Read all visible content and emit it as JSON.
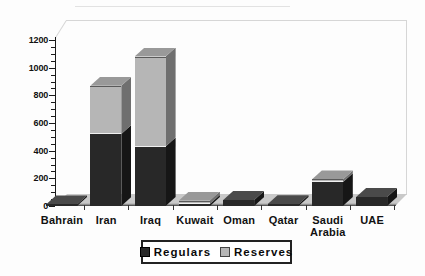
{
  "chart_data": {
    "type": "bar",
    "subtype": "stacked-3d",
    "title": "",
    "xlabel": "",
    "ylabel": "",
    "categories": [
      "Bahrain",
      "Iran",
      "Iraq",
      "Kuwait",
      "Oman",
      "Qatar",
      "Saudi Arabia",
      "UAE"
    ],
    "series": [
      {
        "name": "Regulars",
        "values": [
          11,
          520,
          430,
          15,
          43,
          12,
          172,
          65
        ]
      },
      {
        "name": "Reserves",
        "values": [
          0,
          350,
          650,
          24,
          0,
          0,
          20,
          0
        ]
      }
    ],
    "ylim": [
      0,
      1200
    ],
    "yticks": [
      0,
      200,
      400,
      600,
      800,
      1000,
      1200
    ],
    "minor_tick_step": 50,
    "grid": false,
    "legend_position": "bottom",
    "colors": {
      "regulars_front": "#282828",
      "regulars_side": "#161616",
      "regulars_top": "#4a4a4a",
      "reserves_front": "#b6b6b6",
      "reserves_side": "#6f6f6f",
      "reserves_top": "#999999",
      "floor": "#c9c9c9",
      "axis": "#1a1a1a",
      "background": "#fdfdfd"
    }
  },
  "legend": {
    "items": [
      {
        "label": "Regulars",
        "color": "#282828"
      },
      {
        "label": "Reserves",
        "color": "#b6b6b6"
      }
    ]
  }
}
